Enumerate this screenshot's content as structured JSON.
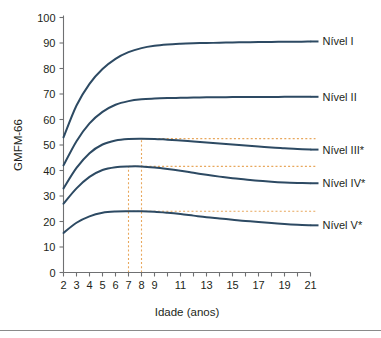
{
  "chart_data": {
    "type": "line",
    "title": "",
    "xlabel": "Idade (anos)",
    "ylabel": "GMFM-66",
    "xlim": [
      2,
      21
    ],
    "ylim": [
      0,
      100
    ],
    "grid": false,
    "legend_position": "right",
    "x_tick_values": [
      2,
      3,
      4,
      5,
      6,
      7,
      8,
      9,
      10,
      11,
      12,
      13,
      14,
      15,
      16,
      17,
      18,
      19,
      20,
      21
    ],
    "x_tick_labels": [
      "2",
      "3",
      "4",
      "5",
      "6",
      "7",
      "8",
      "9",
      "",
      "11",
      "",
      "13",
      "",
      "15",
      "",
      "17",
      "",
      "19",
      "",
      "21"
    ],
    "y_tick_values": [
      0,
      10,
      20,
      30,
      40,
      50,
      60,
      70,
      80,
      90,
      100
    ],
    "y_tick_labels": [
      "0",
      "10",
      "20",
      "30",
      "40",
      "50",
      "60",
      "70",
      "80",
      "90",
      "100"
    ],
    "line_color": "#2d4a63",
    "guide_color": "#e8a75c",
    "x": [
      2,
      3,
      4,
      5,
      6,
      7,
      8,
      9,
      10,
      11,
      12,
      13,
      14,
      15,
      16,
      17,
      18,
      19,
      20,
      21
    ],
    "series": [
      {
        "name": "Nível I",
        "label": "Nível I",
        "color": "#2d4a63",
        "values": [
          53.0,
          65.5,
          74.0,
          79.8,
          83.8,
          86.4,
          88.0,
          88.9,
          89.4,
          89.7,
          89.9,
          90.0,
          90.1,
          90.2,
          90.3,
          90.4,
          90.4,
          90.5,
          90.5,
          90.6
        ],
        "label_y": 90.6
      },
      {
        "name": "Nível II",
        "label": "Nível II",
        "color": "#2d4a63",
        "values": [
          42.0,
          51.5,
          58.5,
          63.0,
          65.8,
          67.2,
          67.9,
          68.2,
          68.4,
          68.5,
          68.6,
          68.7,
          68.7,
          68.8,
          68.8,
          68.8,
          68.8,
          68.9,
          68.9,
          68.9
        ],
        "label_y": 68.9
      },
      {
        "name": "Nível III*",
        "label": "Nível III*",
        "color": "#2d4a63",
        "values": [
          33.0,
          41.0,
          46.8,
          50.2,
          51.8,
          52.4,
          52.5,
          52.4,
          52.1,
          51.8,
          51.4,
          51.0,
          50.6,
          50.2,
          49.8,
          49.4,
          49.0,
          48.7,
          48.4,
          48.2
        ],
        "label_y": 48.2,
        "peak_value": 52.5,
        "peak_age": 8
      },
      {
        "name": "Nível IV*",
        "label": "Nível IV*",
        "color": "#2d4a63",
        "values": [
          27.0,
          33.0,
          37.5,
          40.2,
          41.3,
          41.6,
          41.6,
          41.2,
          40.6,
          39.9,
          39.1,
          38.3,
          37.6,
          37.0,
          36.5,
          36.0,
          35.6,
          35.3,
          35.1,
          35.0
        ],
        "label_y": 35.0,
        "peak_value": 41.6,
        "peak_age": 7
      },
      {
        "name": "Nível V*",
        "label": "Nível V*",
        "color": "#2d4a63",
        "values": [
          15.5,
          19.5,
          22.0,
          23.4,
          23.9,
          24.0,
          24.0,
          23.8,
          23.4,
          22.9,
          22.3,
          21.7,
          21.2,
          20.7,
          20.2,
          19.8,
          19.4,
          19.0,
          18.7,
          18.5
        ],
        "label_y": 18.5,
        "peak_value": 24.0,
        "peak_age": 7
      }
    ],
    "annotations": {
      "vertical_guides": [
        {
          "name": "guide-age-7",
          "age": 7,
          "from_value": 0,
          "to_value": 41.6
        },
        {
          "name": "guide-age-8",
          "age": 8,
          "from_value": 0,
          "to_value": 52.5
        }
      ],
      "horizontal_guides": [
        {
          "name": "guide-level-iii-peak",
          "value": 52.5,
          "from_age": 8,
          "to_age": 21
        },
        {
          "name": "guide-level-iv-peak",
          "value": 41.6,
          "from_age": 7,
          "to_age": 21
        },
        {
          "name": "guide-level-v-peak",
          "value": 24.0,
          "from_age": 7,
          "to_age": 21
        }
      ]
    }
  }
}
